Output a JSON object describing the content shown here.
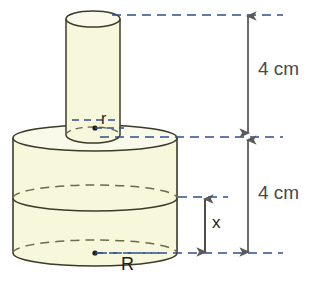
{
  "figure": {
    "colors": {
      "solid_fill": "#f7f7dc",
      "solid_outline": "#3b3b2a",
      "hidden_edge": "#6b6b4a",
      "dimension_line": "#5a5a5a",
      "reference_dash": "#4d6ea8",
      "label_text": "#1d1d1d"
    },
    "labels": {
      "top_dimension": "4 cm",
      "bottom_dimension": "4 cm",
      "partial_height": "x",
      "small_radius": "r",
      "large_radius": "R"
    },
    "shapes": {
      "small_cylinder": {
        "name": "small-cylinder",
        "center_x": 93,
        "radius_x": 27,
        "radius_y": 8,
        "top_y": 19,
        "bottom_y": 135
      },
      "large_cylinder": {
        "name": "large-cylinder",
        "center_x": 95,
        "radius_x": 82,
        "radius_y": 13,
        "top_y": 138,
        "mid_y": 198,
        "bottom_y": 253
      }
    },
    "reference_lines": [
      {
        "name": "top-reference-line",
        "y": 15,
        "x1": 112,
        "x2": 283
      },
      {
        "name": "middle-reference-line",
        "y": 137,
        "x1": 100,
        "x2": 283
      },
      {
        "name": "x-top-reference-line",
        "y": 197,
        "x1": 178,
        "x2": 225
      },
      {
        "name": "bottom-reference-line",
        "y": 253,
        "x1": 98,
        "x2": 283
      }
    ],
    "dimension_arrows": [
      {
        "name": "top-dimension-arrow",
        "x": 248,
        "y1": 16,
        "y2": 133,
        "value": "4 cm"
      },
      {
        "name": "bottom-dimension-arrow",
        "x": 248,
        "y1": 139,
        "y2": 252,
        "value": "4 cm"
      },
      {
        "name": "x-dimension-arrow",
        "x": 205,
        "y1": 198,
        "y2": 252,
        "value": "x"
      }
    ],
    "center_dots": [
      {
        "name": "small-cylinder-center-dot",
        "cx": 95,
        "cy": 128
      },
      {
        "name": "large-cylinder-center-dot",
        "cx": 95,
        "cy": 253
      }
    ]
  }
}
